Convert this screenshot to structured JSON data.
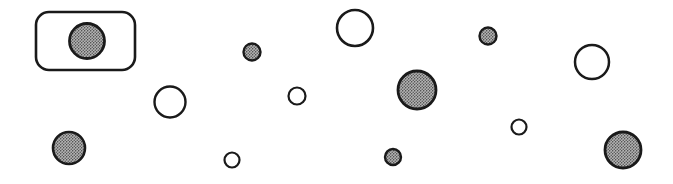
{
  "figure": {
    "width": 673,
    "height": 184,
    "background_color": "#ffffff",
    "stroke_color": "#1a1a1a",
    "filled_circle_fill": "#9a9a9a",
    "open_circle_fill": "#ffffff"
  },
  "highlight_box": {
    "label": "selection-box",
    "x": 36,
    "y": 12,
    "width": 99,
    "height": 58,
    "corner_radius": 13,
    "stroke_width": 2.6,
    "stroke_color": "#1a1a1a",
    "fill": "none"
  },
  "circles": [
    {
      "id": "c1",
      "label": "filled-circle-boxed",
      "cx": 87,
      "cy": 41,
      "r": 17.5,
      "style": "filled",
      "stroke_width": 2.8
    },
    {
      "id": "c2",
      "label": "filled-circle-small-left",
      "cx": 69,
      "cy": 148,
      "r": 16.0,
      "style": "filled",
      "stroke_width": 2.6
    },
    {
      "id": "c3",
      "label": "open-circle-left",
      "cx": 170,
      "cy": 102,
      "r": 15.5,
      "style": "open",
      "stroke_width": 2.4
    },
    {
      "id": "c4",
      "label": "open-circle-tiny-lower-left",
      "cx": 232,
      "cy": 160,
      "r": 7.5,
      "style": "open",
      "stroke_width": 2.2
    },
    {
      "id": "c5",
      "label": "filled-circle-tiny-upper",
      "cx": 252,
      "cy": 52,
      "r": 8.5,
      "style": "filled",
      "stroke_width": 2.4
    },
    {
      "id": "c6",
      "label": "open-circle-tiny-center",
      "cx": 297,
      "cy": 96,
      "r": 8.5,
      "style": "open",
      "stroke_width": 2.2
    },
    {
      "id": "c7",
      "label": "open-circle-top-center",
      "cx": 355,
      "cy": 28,
      "r": 18.0,
      "style": "open",
      "stroke_width": 2.6
    },
    {
      "id": "c8",
      "label": "filled-circle-tiny-lower",
      "cx": 393,
      "cy": 157,
      "r": 8.0,
      "style": "filled",
      "stroke_width": 2.4
    },
    {
      "id": "c9",
      "label": "filled-circle-large-center",
      "cx": 417,
      "cy": 90,
      "r": 19.0,
      "style": "filled",
      "stroke_width": 2.8
    },
    {
      "id": "c10",
      "label": "filled-circle-tiny-right",
      "cx": 488,
      "cy": 36,
      "r": 8.5,
      "style": "filled",
      "stroke_width": 2.4
    },
    {
      "id": "c11",
      "label": "open-circle-tiny-right",
      "cx": 519,
      "cy": 127,
      "r": 7.5,
      "style": "open",
      "stroke_width": 2.2
    },
    {
      "id": "c12",
      "label": "open-circle-right",
      "cx": 592,
      "cy": 62,
      "r": 17.0,
      "style": "open",
      "stroke_width": 2.5
    },
    {
      "id": "c13",
      "label": "filled-circle-lower-right",
      "cx": 623,
      "cy": 150,
      "r": 18.0,
      "style": "filled",
      "stroke_width": 2.8
    }
  ],
  "counts": {
    "total_circles": 13,
    "filled_circles": 7,
    "open_circles": 6,
    "highlight_boxes": 1
  }
}
